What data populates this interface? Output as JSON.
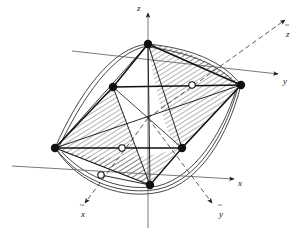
{
  "figure": {
    "background_color": "#ffffff",
    "line_color": "#1a1a1a",
    "hatch_color": "#555555",
    "surface_curve_color": "#333333",
    "width": 304,
    "height": 236
  },
  "axes": [
    {
      "id": "z",
      "label": "z",
      "style": "solid",
      "arrow": "up",
      "label_x": 137,
      "label_y": 11,
      "tilde": false
    },
    {
      "id": "y",
      "label": "y",
      "style": "solid",
      "arrow": "up-right",
      "label_x": 283,
      "label_y": 84,
      "tilde": false
    },
    {
      "id": "x",
      "label": "x",
      "style": "solid",
      "arrow": "down-right",
      "label_x": 238,
      "label_y": 186,
      "tilde": false
    },
    {
      "id": "zt",
      "label": "z",
      "style": "dashed",
      "arrow": "up-right",
      "label_x": 288,
      "label_y": 33,
      "tilde": true
    },
    {
      "id": "yt",
      "label": "y",
      "style": "dashed",
      "arrow": "down-right",
      "label_x": 219,
      "label_y": 214,
      "tilde": true
    },
    {
      "id": "xt",
      "label": "x",
      "style": "dashed",
      "arrow": "down-left",
      "label_x": 81,
      "label_y": 214,
      "tilde": true
    }
  ],
  "nodes": {
    "corner": [
      {
        "id": "n-top",
        "x": 148,
        "y": 44,
        "type": "filled"
      },
      {
        "id": "n-left",
        "x": 113,
        "y": 87,
        "type": "filled"
      },
      {
        "id": "n-right",
        "x": 241,
        "y": 85,
        "type": "filled"
      },
      {
        "id": "n-far-left",
        "x": 55,
        "y": 148,
        "type": "filled"
      },
      {
        "id": "n-mid-right",
        "x": 182,
        "y": 148,
        "type": "filled"
      },
      {
        "id": "n-bottom",
        "x": 150,
        "y": 185,
        "type": "filled"
      }
    ],
    "midside": [
      {
        "id": "m-upper-right",
        "x": 192,
        "y": 85,
        "type": "hollow"
      },
      {
        "id": "m-lower-mid",
        "x": 122,
        "y": 148,
        "type": "hollow"
      },
      {
        "id": "m-lower-left",
        "x": 101,
        "y": 175,
        "type": "hollow"
      }
    ],
    "filled_fill": "#111111",
    "hollow_fill": "#ffffff",
    "hollow_stroke": "#111111",
    "corner_radius": 4.2,
    "midside_radius": 3.2
  },
  "origin": {
    "x": 148,
    "y": 118
  },
  "mesh_edges": [
    {
      "from": "n-top",
      "to": "n-right"
    },
    {
      "from": "n-top",
      "to": "n-left"
    },
    {
      "from": "n-left",
      "to": "n-right"
    },
    {
      "from": "n-left",
      "to": "n-far-left"
    },
    {
      "from": "n-far-left",
      "to": "n-mid-right"
    },
    {
      "from": "n-far-left",
      "to": "n-right"
    },
    {
      "from": "n-right",
      "to": "n-mid-right"
    },
    {
      "from": "n-mid-right",
      "to": "n-bottom"
    },
    {
      "from": "n-bottom",
      "to": "n-far-left"
    },
    {
      "from": "n-top",
      "to": "n-mid-right"
    },
    {
      "from": "n-top",
      "to": "n-bottom"
    },
    {
      "from": "n-left",
      "to": "n-bottom"
    },
    {
      "from": "n-left",
      "to": "n-mid-right"
    }
  ],
  "regions": [
    {
      "id": "hatched-upper-right",
      "hatch": true
    },
    {
      "id": "hatched-left",
      "hatch": true
    },
    {
      "id": "hatched-lower",
      "hatch": true
    }
  ],
  "surface": {
    "description": "doubly curved saddle boundary",
    "stroke": "#333333"
  }
}
